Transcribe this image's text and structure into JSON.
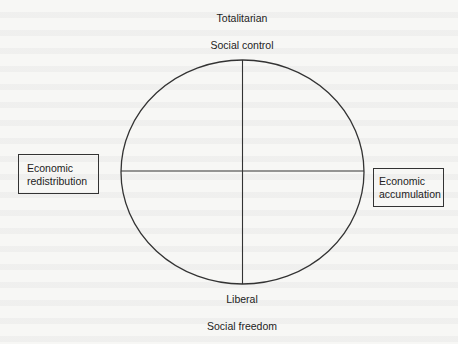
{
  "diagram": {
    "type": "political-compass-ellipse",
    "colors": {
      "line": "#333333",
      "background": "#f7f7f5",
      "text": "#222222"
    },
    "top": {
      "title": "Totalitarian",
      "subtitle": "Social control"
    },
    "bottom": {
      "title": "Liberal",
      "subtitle": "Social freedom"
    },
    "left_box": {
      "line1": "Economic",
      "line2": "redistribution"
    },
    "right_box": {
      "line1": "Economic",
      "line2": "accumulation"
    }
  }
}
